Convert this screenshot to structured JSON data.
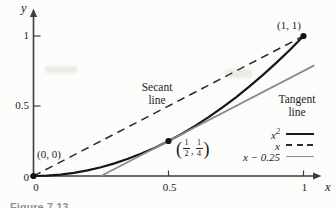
{
  "figure": {
    "caption": "Figure 7.13",
    "background": "#fcfcfa"
  },
  "axis_labels": {
    "x": "x",
    "y": "y"
  },
  "annotations": {
    "origin": "(0, 0)",
    "point_one": "(1, 1)",
    "secant": {
      "line1": "Secant",
      "line2": "line"
    },
    "tangent": {
      "line1": "Tangent",
      "line2": "line"
    },
    "midpoint": {
      "open": "(",
      "f1n": "1",
      "f1d": "2",
      "comma": ",",
      "f2n": "1",
      "f2d": "4",
      "close": ")"
    }
  },
  "legend": {
    "items": [
      {
        "base": "x",
        "sup": "2",
        "style": "solid-dark"
      },
      {
        "base": "x",
        "sup": "",
        "style": "dashed"
      },
      {
        "base": "x − 0.25",
        "sup": "",
        "style": "solid-gray"
      }
    ]
  },
  "chart_data": {
    "type": "line",
    "title": "",
    "xlabel": "x",
    "ylabel": "y",
    "xlim": [
      0,
      1.08
    ],
    "ylim": [
      0,
      1.15
    ],
    "grid": false,
    "x_ticks": [
      {
        "v": 0,
        "label": "0"
      },
      {
        "v": 0.5,
        "label": "0.5"
      },
      {
        "v": 1,
        "label": "1"
      }
    ],
    "y_ticks": [
      {
        "v": 0,
        "label": "0"
      },
      {
        "v": 0.5,
        "label": "0.5"
      },
      {
        "v": 1,
        "label": "1"
      }
    ],
    "series": [
      {
        "name": "x²",
        "equation": "y = x²",
        "style": "solid-dark",
        "x": [
          0,
          0.05,
          0.1,
          0.15,
          0.2,
          0.25,
          0.3,
          0.35,
          0.4,
          0.45,
          0.5,
          0.55,
          0.6,
          0.65,
          0.7,
          0.75,
          0.8,
          0.85,
          0.9,
          0.95,
          1
        ],
        "y": [
          0,
          0.0025,
          0.01,
          0.0225,
          0.04,
          0.0625,
          0.09,
          0.1225,
          0.16,
          0.2025,
          0.25,
          0.3025,
          0.36,
          0.4225,
          0.49,
          0.5625,
          0.64,
          0.7225,
          0.81,
          0.9025,
          1
        ]
      },
      {
        "name": "x",
        "equation": "y = x (secant line through (0,0) and (1,1))",
        "style": "dashed",
        "x": [
          0,
          1
        ],
        "y": [
          0,
          1
        ]
      },
      {
        "name": "x − 0.25",
        "equation": "y = x − 0.25 (tangent line at (1/2, 1/4))",
        "style": "solid-gray",
        "x": [
          0.25,
          1.04
        ],
        "y": [
          0,
          0.79
        ]
      }
    ],
    "points": [
      {
        "x": 0,
        "y": 0,
        "label": "(0, 0)"
      },
      {
        "x": 0.5,
        "y": 0.25,
        "label": "(1/2, 1/4)"
      },
      {
        "x": 1,
        "y": 1,
        "label": "(1, 1)"
      }
    ],
    "legend": {
      "position": "lower right",
      "entries": [
        "x²",
        "x",
        "x − 0.25"
      ]
    },
    "annotations_text": [
      "Secant line",
      "Tangent line"
    ]
  }
}
